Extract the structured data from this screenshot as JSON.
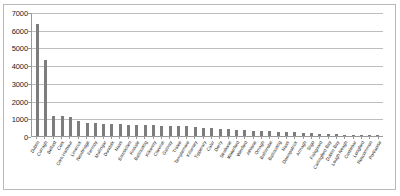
{
  "chart_data": {
    "type": "bar",
    "title": "",
    "xlabel": "",
    "ylabel": "",
    "ylim": [
      0,
      7000
    ],
    "ytick_values": [
      0,
      1000,
      2000,
      3000,
      4000,
      5000,
      6000,
      7000
    ],
    "ytick_labels": [
      "0",
      "1000",
      "2000",
      "3000",
      "4000",
      "5000",
      "6000",
      "7000"
    ],
    "grid": true,
    "legend": "none",
    "bar_color": "#7d7d7d",
    "categories": [
      "Dublin",
      "Curragh",
      "Belfast",
      "Cork",
      "Cork Harbour",
      "Limerick",
      "Newbridge",
      "Fermoy",
      "Mullingar",
      "Dundalk",
      "Naas",
      "Enniskillen",
      "Kinsale",
      "Ballincollig",
      "Kilkenny",
      "Clonmel",
      "Galway",
      "Tralee",
      "Templemore",
      "Killarney",
      "Tipperary",
      "Cahir",
      "Derry",
      "Strabane",
      "Waterford",
      "Wexford",
      "Athlone",
      "Omagh",
      "Ballinrobe",
      "Ballincollig",
      "Naas",
      "Downpatrick",
      "Armagh",
      "Sligo",
      "Fishguard",
      "Carlingford Bay",
      "Dublin Bay",
      "Lough Neagh",
      "Castlebar",
      "Longford",
      "Roscommon",
      "Portlaoise"
    ],
    "values": [
      6300,
      4300,
      1150,
      1150,
      1100,
      820,
      760,
      720,
      700,
      690,
      660,
      640,
      620,
      610,
      600,
      590,
      580,
      560,
      540,
      520,
      470,
      430,
      400,
      380,
      340,
      320,
      300,
      280,
      260,
      240,
      220,
      200,
      180,
      160,
      140,
      120,
      100,
      80,
      60,
      50,
      40,
      30
    ]
  }
}
